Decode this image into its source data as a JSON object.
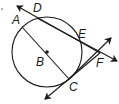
{
  "diagram": {
    "type": "geometry",
    "points": {
      "A": {
        "label": "A",
        "x": 22,
        "y": 27
      },
      "B": {
        "label": "B",
        "x": 47,
        "y": 52
      },
      "C": {
        "label": "C",
        "x": 69,
        "y": 79
      },
      "D": {
        "label": "D",
        "x": 37,
        "y": 18
      },
      "E": {
        "label": "E",
        "x": 80,
        "y": 40
      },
      "F": {
        "label": "F",
        "x": 100,
        "y": 53
      }
    },
    "circle": {
      "center": "B",
      "cx": 47,
      "cy": 52,
      "r": 35
    },
    "lines": [
      {
        "name": "secant-DE",
        "through": [
          "D",
          "E",
          "F"
        ],
        "arrows": "both"
      },
      {
        "name": "tangent-CF",
        "through": [
          "C",
          "F"
        ],
        "arrows": "both"
      },
      {
        "name": "segment-AC",
        "through": [
          "A",
          "B",
          "C"
        ],
        "arrows": "none"
      }
    ],
    "stroke_color": "#1a1a1a"
  }
}
